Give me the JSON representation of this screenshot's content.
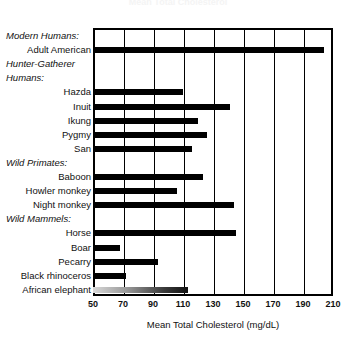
{
  "chart_data": {
    "type": "bar",
    "orientation": "horizontal",
    "title": "Mean Total Cholesterol",
    "xlabel": "Mean Total Cholesterol (mg/dL)",
    "ylabel": "",
    "xlim": [
      50,
      210
    ],
    "xticks": [
      50,
      70,
      90,
      110,
      130,
      150,
      170,
      190,
      210
    ],
    "xtick_labels": [
      "50",
      "70",
      "90",
      "110",
      "130",
      "150",
      "170",
      "190",
      "210"
    ],
    "grid": true,
    "legend": false,
    "bar_color": "#000000",
    "rows": [
      {
        "label": "Modern Humans:",
        "type": "group",
        "value": null
      },
      {
        "label": "Adult American",
        "type": "bar",
        "value": 204
      },
      {
        "label": "Hunter-Gatherer",
        "type": "group",
        "value": null
      },
      {
        "label": "Humans:",
        "type": "group",
        "value": null
      },
      {
        "label": "Hazda",
        "type": "bar",
        "value": 110
      },
      {
        "label": "Inuit",
        "type": "bar",
        "value": 141
      },
      {
        "label": "Ikung",
        "type": "bar",
        "value": 120
      },
      {
        "label": "Pygmy",
        "type": "bar",
        "value": 126
      },
      {
        "label": "San",
        "type": "bar",
        "value": 116
      },
      {
        "label": "Wild Primates:",
        "type": "group",
        "value": null
      },
      {
        "label": "Baboon",
        "type": "bar",
        "value": 123
      },
      {
        "label": "Howler monkey",
        "type": "bar",
        "value": 106
      },
      {
        "label": "Night monkey",
        "type": "bar",
        "value": 144
      },
      {
        "label": "Wild Mammels:",
        "type": "group",
        "value": null
      },
      {
        "label": "Horse",
        "type": "bar",
        "value": 145
      },
      {
        "label": "Boar",
        "type": "bar",
        "value": 68
      },
      {
        "label": "Pecarry",
        "type": "bar",
        "value": 93
      },
      {
        "label": "Black rhinoceros",
        "type": "bar",
        "value": 72
      },
      {
        "label": "African elephant",
        "type": "bar",
        "value": 113,
        "faded": true
      }
    ]
  }
}
